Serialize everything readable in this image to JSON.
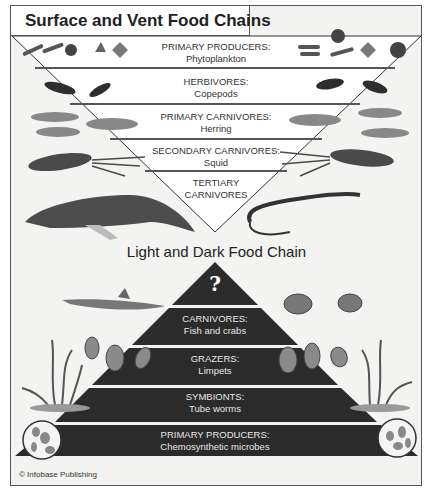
{
  "title": "Surface and Vent Food Chains",
  "surface_chain": {
    "levels": [
      {
        "heading": "PRIMARY PRODUCERS:",
        "organism": "Phytoplankton"
      },
      {
        "heading": "HERBIVORES:",
        "organism": "Copepods"
      },
      {
        "heading": "PRIMARY CARNIVORES:",
        "organism": "Herring"
      },
      {
        "heading": "SECONDARY CARNIVORES:",
        "organism": "Squid"
      },
      {
        "heading": "TERTIARY",
        "organism": "CARNIVORES"
      }
    ],
    "illustrations": [
      "phytoplankton",
      "copepod",
      "herring",
      "squid",
      "whale",
      "eel"
    ]
  },
  "vent_chain": {
    "title": "Light and Dark Food Chain",
    "apex": "?",
    "levels": [
      {
        "heading": "CARNIVORES:",
        "organism": "Fish and crabs"
      },
      {
        "heading": "GRAZERS:",
        "organism": "Limpets"
      },
      {
        "heading": "SYMBIONTS:",
        "organism": "Tube worms"
      },
      {
        "heading": "PRIMARY PRODUCERS:",
        "organism": "Chemosynthetic microbes"
      }
    ],
    "illustrations": [
      "fish",
      "crab",
      "limpet",
      "tube-worm",
      "microbe"
    ]
  },
  "credit": "© Infobase Publishing",
  "colors": {
    "pyramid": "#2b2b2b",
    "band_line": "#444444",
    "background": "#f3f3f1"
  }
}
